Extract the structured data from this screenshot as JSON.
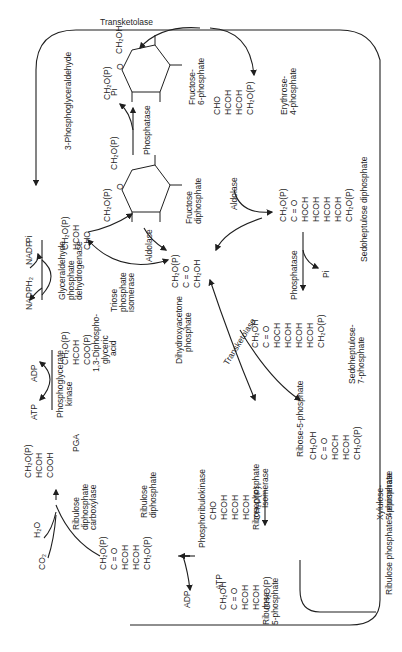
{
  "figure": {
    "orientation": "rotated 90 degrees counter-clockwise",
    "line_color": "#1f1f1f",
    "background": "#ffffff"
  },
  "enzymes": {
    "transketolase_top": "Transketolase",
    "transketolase_mid": "Transketolase",
    "phosphatase_top": "Phosphatase",
    "phosphatase_mid": "Phosphatase",
    "aldolase_1": "Aldolase",
    "aldolase_2": "Aldolase",
    "triose_isomerase": [
      "Triose",
      "phosphate",
      "isomerase"
    ],
    "g3p_dehydrogenase": [
      "Glyceraldehyde",
      "phosphate",
      "dehydrogenase"
    ],
    "pg_kinase": [
      "Phosphoglycerate",
      "kinase"
    ],
    "rubisco": [
      "Ribulose",
      "diphosphate",
      "carboxylase"
    ],
    "phosphoribulokinase": "Phosphoribulokinase",
    "ribosephosphate_isomerase": [
      "Ribosephosphate",
      "Isomerase"
    ],
    "epimerase": "Ribulose phosphate 4 epimerase"
  },
  "cofactors": {
    "pi_top": "Pi",
    "pi_g3p": "Pi",
    "pi_sedo": "Pi",
    "nadph2": "NADPH₂",
    "nadp": "NADP",
    "adp_kinase": "ADP",
    "atp_kinase": "ATP",
    "h2o": "H₂O",
    "co2": "CO₂",
    "adp_prk": "ADP",
    "atp_prk": "ATP"
  },
  "compounds": {
    "f6p": {
      "name": [
        "Fructose-",
        "6-phosphate"
      ]
    },
    "fdp": {
      "name": [
        "Fructose",
        "diphosphate"
      ]
    },
    "e4p": {
      "name": [
        "Erythrose-",
        "4-phosphate"
      ],
      "formula": [
        "CHO",
        "HCOH",
        "HCOH",
        "CH₂O(P)"
      ]
    },
    "sdp": {
      "name": "Sedoheptulose diphosphate",
      "formula": [
        "CH₂O(P)",
        "C = O",
        "HOCH",
        "HCOH",
        "HCOH",
        "HCOH",
        "CH₂O(P)"
      ]
    },
    "s7p": {
      "name": [
        "Sedoheptulose-",
        "7-phosphate"
      ],
      "formula": [
        "CH₂OH",
        "C = O",
        "HOCH",
        "HCOH",
        "HCOH",
        "HCOH",
        "CH₂O(P)"
      ]
    },
    "g3p": {
      "name": "3-Phosphoglyceraldehyde",
      "formula": [
        "CH₂O(P)",
        "HCOH",
        "CHO"
      ]
    },
    "dhap": {
      "name": [
        "Dihydroxyacetone",
        "phosphate"
      ],
      "formula": [
        "CH₂O(P)",
        "C = O",
        "CH₂OH"
      ]
    },
    "bpg": {
      "name": [
        "1,3-Diphospho-",
        "glyceric",
        "acid"
      ],
      "formula": [
        "CH₂O(P)",
        "HCOH",
        "COO(P)"
      ]
    },
    "pga": {
      "name": "PGA",
      "formula": [
        "CH₂O(P)",
        "HCOH",
        "COOH"
      ]
    },
    "rudp": {
      "name": [
        "Ribulose",
        "diphosphate"
      ],
      "formula": [
        "CH₂O(P)",
        "C = O",
        "HCOH",
        "HCOH",
        "CH₂O(P)"
      ]
    },
    "r5p": {
      "name": "Ribose-5-phosphate",
      "formula": [
        "CHO",
        "HCOH",
        "HCOH",
        "HCOH",
        "CH₂O(P)"
      ]
    },
    "ru5p": {
      "name": [
        "Ribulose-",
        "5-phosphate"
      ],
      "formula": [
        "CH₂OH",
        "C = O",
        "HCOH",
        "HCOH",
        "CH₂O(P)"
      ]
    },
    "xu5p": {
      "name": [
        "Xylulose-",
        "5-phosphate"
      ],
      "formula": [
        "CH₂OH",
        "C = O",
        "HOCH",
        "HCOH",
        "CH₂O(P)"
      ]
    }
  },
  "ring_labels": {
    "ch2op": "CH₂O(P)",
    "ch2oh": "CH₂OH",
    "o": "O",
    "oh": "OH",
    "h": "H"
  }
}
